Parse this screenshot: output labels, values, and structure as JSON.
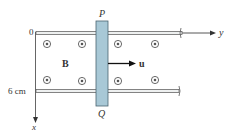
{
  "diagram": {
    "rod": {
      "top_label": "P",
      "bottom_label": "Q",
      "fill_color": "#a8c8d6",
      "edge_color": "#4a6470"
    },
    "field": {
      "label": "B",
      "symbol": "dot-out-of-page"
    },
    "velocity": {
      "label": "u"
    },
    "axes": {
      "x_label": "x",
      "y_label": "y"
    },
    "rails": {
      "top_label": "0",
      "bottom_label": "6 cm"
    }
  }
}
